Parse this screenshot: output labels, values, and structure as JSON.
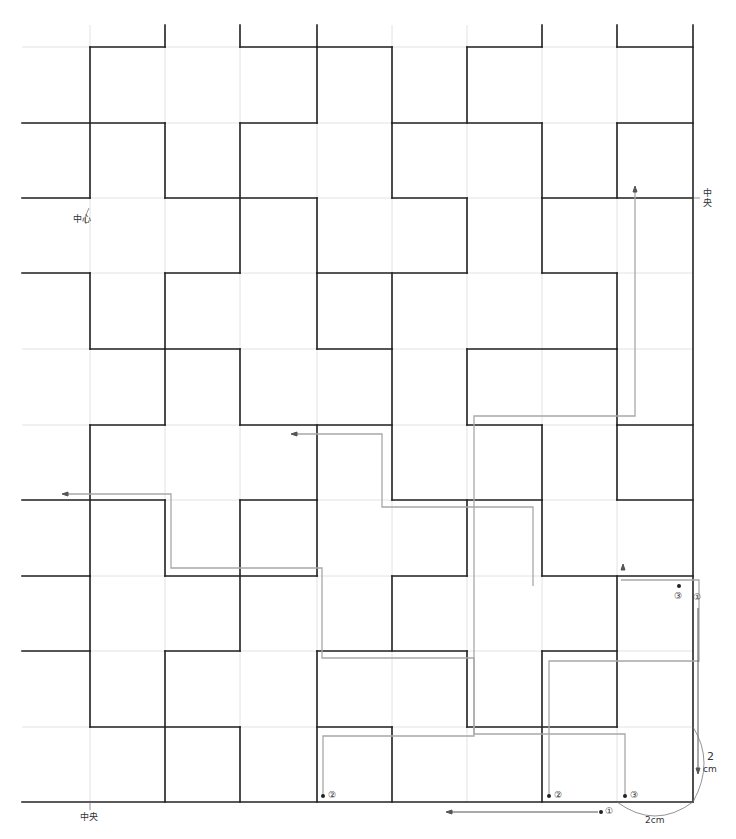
{
  "diagram": {
    "type": "sashiko stitch pattern chart",
    "grid": {
      "cols_x": [
        22,
        90,
        165,
        240,
        317,
        392,
        467,
        542,
        617,
        693
      ],
      "rows_y": [
        47,
        123,
        198,
        273,
        349,
        425,
        500,
        576,
        651,
        727,
        802
      ],
      "cell_size_label": "2cm",
      "grid_color": "#e2e2e2",
      "pattern_color": "#222222",
      "stitch_color": "#a8a8a8"
    },
    "labels": {
      "center_top": "中心",
      "center_right": "中央",
      "center_bottom": "中央",
      "dim_vertical_num": "2",
      "dim_vertical_unit": "cm",
      "dim_horizontal": "2cm",
      "step1": "①",
      "step2": "②",
      "step3": "③"
    }
  }
}
